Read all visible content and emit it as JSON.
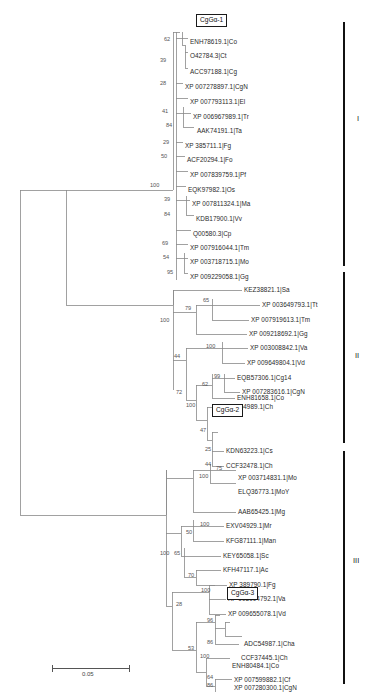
{
  "figure": {
    "type": "phylogenetic-tree",
    "scale_bar": {
      "value": "0.05",
      "label": "0.05"
    },
    "top_cropped_header": ""
  },
  "clades": [
    {
      "id": "I",
      "roman": "I",
      "bar_top": 22,
      "bar_bottom": 266
    },
    {
      "id": "II",
      "roman": "II",
      "bar_top": 272,
      "bar_bottom": 443
    },
    {
      "id": "III",
      "roman": "III",
      "bar_top": 451,
      "bar_bottom": 684
    }
  ],
  "boxed_taxa": [
    {
      "label": "CgGα-1",
      "x": 196,
      "y": 14
    },
    {
      "label": "CgGα-2",
      "x": 212,
      "y": 404
    },
    {
      "label": "CgGα-3",
      "x": 227,
      "y": 587
    }
  ],
  "tips": [
    {
      "label": "ENH78619.1|Co",
      "x": 190,
      "y": 42,
      "clade": "I"
    },
    {
      "label": "O42784.3|Ct",
      "x": 190,
      "y": 57,
      "clade": "I"
    },
    {
      "label": "ACC97188.1|Cg",
      "x": 190,
      "y": 72,
      "clade": "I"
    },
    {
      "label": "XP 007278897.1|CgN",
      "x": 185,
      "y": 87,
      "clade": "I"
    },
    {
      "label": "XP 007793113.1|El",
      "x": 190,
      "y": 102,
      "clade": "I"
    },
    {
      "label": "XP 006967989.1|Tr",
      "x": 193,
      "y": 117,
      "clade": "I"
    },
    {
      "label": "AAK74191.1|Ta",
      "x": 197,
      "y": 131,
      "clade": "I"
    },
    {
      "label": "XP 385711.1|Fg",
      "x": 185,
      "y": 146,
      "clade": "I"
    },
    {
      "label": "ACF20294.1|Fo",
      "x": 187,
      "y": 160,
      "clade": "I"
    },
    {
      "label": "XP 007839759.1|Pf",
      "x": 190,
      "y": 175,
      "clade": "I"
    },
    {
      "label": "EQK97982.1|Os",
      "x": 188,
      "y": 190,
      "clade": "I"
    },
    {
      "label": "XP 007811324.1|Ma",
      "x": 192,
      "y": 204,
      "clade": "I"
    },
    {
      "label": "KDB17900.1|Vv",
      "x": 196,
      "y": 219,
      "clade": "I"
    },
    {
      "label": "Q00580.3|Cp",
      "x": 193,
      "y": 234,
      "clade": "I"
    },
    {
      "label": "XP 007916044.1|Tm",
      "x": 190,
      "y": 248,
      "clade": "I"
    },
    {
      "label": "XP 003718715.1|Mo",
      "x": 190,
      "y": 262,
      "clade": "I"
    },
    {
      "label": "XP 009229058.1|Gg",
      "x": 190,
      "y": 277,
      "clade": "I"
    },
    {
      "label": "KEZ38821.1|Sa",
      "x": 244,
      "y": 294,
      "clade": "II"
    },
    {
      "label": "XP 003649793.1|Tt",
      "x": 262,
      "y": 309,
      "clade": "II"
    },
    {
      "label": "XP 007919613.1|Tm",
      "x": 251,
      "y": 324,
      "clade": "II"
    },
    {
      "label": "XP 009218692.1|Gg",
      "x": 249,
      "y": 338,
      "clade": "II"
    },
    {
      "label": "XP 003008842.1|Va",
      "x": 250,
      "y": 353,
      "clade": "II"
    },
    {
      "label": "XP 009649804.1|Vd",
      "x": 247,
      "y": 367,
      "clade": "II"
    },
    {
      "label": "EQB57306.1|Cg14",
      "x": 237,
      "y": 382,
      "clade": "II"
    },
    {
      "label": "XP 007283616.1|CgN",
      "x": 242,
      "y": 396,
      "clade": "II"
    },
    {
      "label": "ENH81658.1|Co",
      "x": 237,
      "y": 411,
      "clade": "II"
    },
    {
      "label": "ADC54989.1|Ch",
      "x": 226,
      "y": 425,
      "clade": "II"
    },
    {
      "label": "KDN63223.1|Cs",
      "x": 226,
      "y": 455,
      "clade": "II"
    },
    {
      "label": "CCF32478.1|Ch",
      "x": 226,
      "y": 470,
      "clade": "II"
    },
    {
      "label": "XP 003714831.1|Mo",
      "x": 238,
      "y": 487,
      "clade": "III"
    },
    {
      "label": "ELQ36773.1|MoY",
      "x": 238,
      "y": 502,
      "clade": "III"
    },
    {
      "label": "AAB65425.1|Mg",
      "x": 238,
      "y": 516,
      "clade": "III"
    },
    {
      "label": "EXV04929.1|Mr",
      "x": 226,
      "y": 531,
      "clade": "III"
    },
    {
      "label": "KFG87111.1|Man",
      "x": 226,
      "y": 545,
      "clade": "III"
    },
    {
      "label": "KEY65058.1|Sc",
      "x": 223,
      "y": 560,
      "clade": "III"
    },
    {
      "label": "KFH47117.1|Ac",
      "x": 223,
      "y": 574,
      "clade": "III"
    },
    {
      "label": "XP 389790.1|Fg",
      "x": 229,
      "y": 589,
      "clade": "III"
    },
    {
      "label": "XP 003004792.1|Va",
      "x": 228,
      "y": 604,
      "clade": "III"
    },
    {
      "label": "XP 009655078.1|Vd",
      "x": 228,
      "y": 618,
      "clade": "III"
    },
    {
      "label": "ADC54987.1|Cha",
      "x": 244,
      "y": 648,
      "clade": "III"
    },
    {
      "label": "CCF37445.1|Ch",
      "x": 241,
      "y": 662,
      "clade": "III"
    },
    {
      "label": "ENH80484.1|Co",
      "x": 232,
      "y": 677,
      "clade": "III"
    },
    {
      "label": "XP 007599882.1|Cf",
      "x": 234,
      "y": 691,
      "clade": "III"
    },
    {
      "label": "XP 007280300.1|CgN",
      "x": 234,
      "y": 706,
      "clade": "III"
    }
  ],
  "bootstraps": [
    {
      "value": "62",
      "x": 169,
      "y": 41
    },
    {
      "value": "39",
      "x": 165,
      "y": 62
    },
    {
      "value": "28",
      "x": 165,
      "y": 86
    },
    {
      "value": "41",
      "x": 167,
      "y": 114
    },
    {
      "value": "84",
      "x": 171,
      "y": 128
    },
    {
      "value": "29",
      "x": 168,
      "y": 145
    },
    {
      "value": "50",
      "x": 166,
      "y": 159
    },
    {
      "value": "100",
      "x": 155,
      "y": 187
    },
    {
      "value": "39",
      "x": 169,
      "y": 203
    },
    {
      "value": "84",
      "x": 169,
      "y": 218
    },
    {
      "value": "69",
      "x": 167,
      "y": 247
    },
    {
      "value": "54",
      "x": 168,
      "y": 261
    },
    {
      "value": "95",
      "x": 172,
      "y": 276
    },
    {
      "value": "65",
      "x": 208,
      "y": 302
    },
    {
      "value": "79",
      "x": 196,
      "y": 310
    },
    {
      "value": "100",
      "x": 177,
      "y": 322
    },
    {
      "value": "44",
      "x": 179,
      "y": 351
    },
    {
      "value": "100",
      "x": 218,
      "y": 352
    },
    {
      "value": "99",
      "x": 220,
      "y": 381
    },
    {
      "value": "62",
      "x": 208,
      "y": 389
    },
    {
      "value": "72",
      "x": 182,
      "y": 394
    },
    {
      "value": "100",
      "x": 196,
      "y": 417
    },
    {
      "value": "47",
      "x": 206,
      "y": 432
    },
    {
      "value": "25",
      "x": 211,
      "y": 454
    },
    {
      "value": "44",
      "x": 211,
      "y": 469
    },
    {
      "value": "75",
      "x": 222,
      "y": 485
    },
    {
      "value": "100",
      "x": 209,
      "y": 494
    },
    {
      "value": "100",
      "x": 206,
      "y": 530
    },
    {
      "value": "50",
      "x": 192,
      "y": 538
    },
    {
      "value": "100",
      "x": 166,
      "y": 559
    },
    {
      "value": "65",
      "x": 180,
      "y": 559
    },
    {
      "value": "70",
      "x": 194,
      "y": 581
    },
    {
      "value": "100",
      "x": 207,
      "y": 603
    },
    {
      "value": "28",
      "x": 182,
      "y": 610
    },
    {
      "value": "96",
      "x": 213,
      "y": 632
    },
    {
      "value": "86",
      "x": 213,
      "y": 647
    },
    {
      "value": "53",
      "x": 194,
      "y": 654
    },
    {
      "value": "100",
      "x": 206,
      "y": 676
    },
    {
      "value": "64",
      "x": 213,
      "y": 690
    },
    {
      "value": "86",
      "x": 213,
      "y": 705
    }
  ]
}
